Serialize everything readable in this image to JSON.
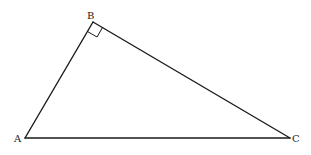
{
  "diagram": {
    "type": "right-triangle",
    "vertices": {
      "A": {
        "label": "A",
        "x": 25,
        "y": 138
      },
      "B": {
        "label": "B",
        "x": 93,
        "y": 22
      },
      "C": {
        "label": "C",
        "x": 290,
        "y": 138
      }
    },
    "right_angle_at": "B",
    "colors": {
      "line": "#1a1a1a",
      "background": "#ffffff",
      "label": "#222222"
    }
  }
}
